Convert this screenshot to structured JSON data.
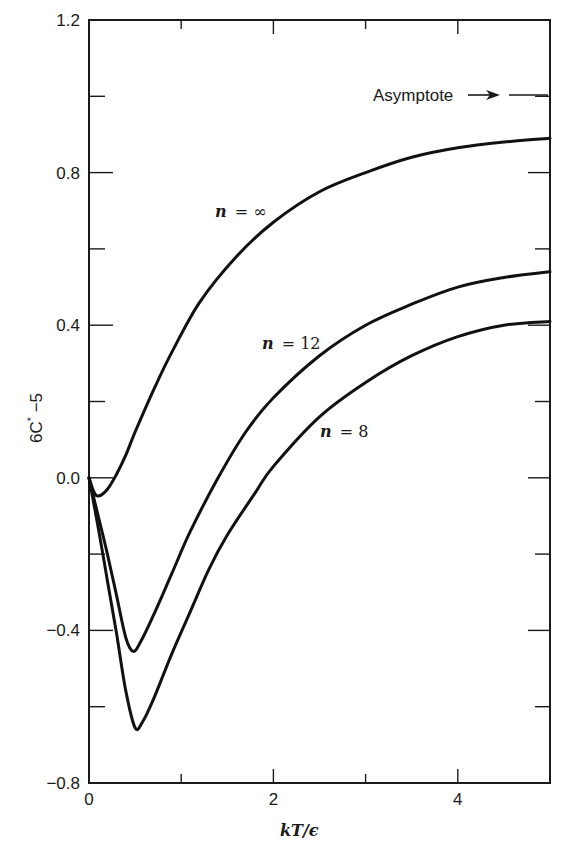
{
  "chart_data": {
    "type": "line",
    "title": "",
    "xlabel": "kT/ϵ",
    "ylabel": "6C* −5",
    "xlim": [
      0,
      5
    ],
    "ylim": [
      -0.8,
      1.2
    ],
    "x_ticks": [
      0,
      1,
      2,
      3,
      4,
      5
    ],
    "x_tick_labels": [
      "0",
      "",
      "2",
      "",
      "4",
      ""
    ],
    "y_ticks": [
      -0.8,
      -0.6,
      -0.4,
      -0.2,
      0.0,
      0.2,
      0.4,
      0.6,
      0.8,
      1.0,
      1.2
    ],
    "y_tick_labels": [
      "−0.8",
      "",
      "−0.4",
      "",
      "0.0",
      "",
      "0.4",
      "",
      "0.8",
      "",
      "1.2"
    ],
    "grid": false,
    "legend": "none (inline curve labels)",
    "annotations": [
      {
        "text": "Asymptote →",
        "y": 1.0,
        "position": "right edge"
      }
    ],
    "series": [
      {
        "name": "n = ∞",
        "label_n": "n",
        "label_value": "= ∞",
        "points": [
          [
            0,
            0.0
          ],
          [
            0.05,
            -0.035
          ],
          [
            0.1,
            -0.048
          ],
          [
            0.2,
            -0.03
          ],
          [
            0.3,
            0.01
          ],
          [
            0.4,
            0.06
          ],
          [
            0.5,
            0.12
          ],
          [
            0.7,
            0.23
          ],
          [
            0.9,
            0.33
          ],
          [
            1.2,
            0.46
          ],
          [
            1.6,
            0.58
          ],
          [
            2.0,
            0.67
          ],
          [
            2.5,
            0.75
          ],
          [
            3.0,
            0.8
          ],
          [
            3.5,
            0.84
          ],
          [
            4.0,
            0.865
          ],
          [
            4.5,
            0.88
          ],
          [
            5.0,
            0.89
          ]
        ]
      },
      {
        "name": "n = 12",
        "label_n": "n",
        "label_value": "= 12",
        "points": [
          [
            0,
            0.0
          ],
          [
            0.1,
            -0.1
          ],
          [
            0.2,
            -0.2
          ],
          [
            0.3,
            -0.31
          ],
          [
            0.4,
            -0.42
          ],
          [
            0.48,
            -0.455
          ],
          [
            0.56,
            -0.43
          ],
          [
            0.7,
            -0.36
          ],
          [
            0.9,
            -0.25
          ],
          [
            1.1,
            -0.14
          ],
          [
            1.4,
            0.0
          ],
          [
            1.7,
            0.12
          ],
          [
            2.0,
            0.21
          ],
          [
            2.5,
            0.32
          ],
          [
            3.0,
            0.4
          ],
          [
            3.5,
            0.455
          ],
          [
            4.0,
            0.5
          ],
          [
            4.5,
            0.525
          ],
          [
            5.0,
            0.54
          ]
        ]
      },
      {
        "name": "n = 8",
        "label_n": "n",
        "label_value": "= 8",
        "points": [
          [
            0,
            0.0
          ],
          [
            0.1,
            -0.13
          ],
          [
            0.2,
            -0.27
          ],
          [
            0.3,
            -0.41
          ],
          [
            0.4,
            -0.56
          ],
          [
            0.5,
            -0.655
          ],
          [
            0.58,
            -0.64
          ],
          [
            0.7,
            -0.58
          ],
          [
            0.9,
            -0.46
          ],
          [
            1.1,
            -0.35
          ],
          [
            1.3,
            -0.24
          ],
          [
            1.5,
            -0.15
          ],
          [
            1.8,
            -0.04
          ],
          [
            2.0,
            0.03
          ],
          [
            2.5,
            0.16
          ],
          [
            3.0,
            0.25
          ],
          [
            3.5,
            0.32
          ],
          [
            4.0,
            0.37
          ],
          [
            4.5,
            0.4
          ],
          [
            5.0,
            0.41
          ]
        ]
      }
    ]
  },
  "labels": {
    "asymptote": "Asymptote",
    "x_axis_title": "kT/ϵ",
    "y_axis_main": "6C",
    "y_axis_sup": "*",
    "y_axis_tail": " −5"
  }
}
